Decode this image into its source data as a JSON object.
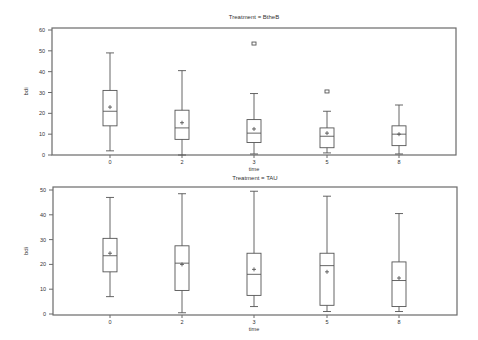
{
  "chart_data": [
    {
      "type": "box",
      "title": "Treatment = BtheB",
      "xlabel": "time",
      "ylabel": "bdi",
      "categories": [
        "0",
        "2",
        "3",
        "5",
        "8"
      ],
      "yticks": [
        0,
        10,
        20,
        30,
        40,
        50,
        60
      ],
      "ylim": [
        0,
        60
      ],
      "grid": false,
      "boxes": [
        {
          "x": "0",
          "whisker_low": 2,
          "q1": 14,
          "median": 21,
          "mean": 23,
          "q3": 31,
          "whisker_high": 49,
          "outliers": []
        },
        {
          "x": "2",
          "whisker_low": 0,
          "q1": 7.5,
          "median": 13,
          "mean": 15.5,
          "q3": 21.5,
          "whisker_high": 40.5,
          "outliers": []
        },
        {
          "x": "3",
          "whisker_low": 0.5,
          "q1": 6,
          "median": 10.5,
          "mean": 12.5,
          "q3": 17,
          "whisker_high": 29.5,
          "outliers": [
            53.5
          ]
        },
        {
          "x": "5",
          "whisker_low": 1,
          "q1": 3.5,
          "median": 9,
          "mean": 10.5,
          "q3": 13,
          "whisker_high": 21,
          "outliers": [
            30.5
          ]
        },
        {
          "x": "8",
          "whisker_low": 0.5,
          "q1": 4.5,
          "median": 10,
          "mean": 10,
          "q3": 14,
          "whisker_high": 24,
          "outliers": []
        }
      ]
    },
    {
      "type": "box",
      "title": "Treatment = TAU",
      "xlabel": "time",
      "ylabel": "bdi",
      "categories": [
        "0",
        "2",
        "3",
        "5",
        "8"
      ],
      "yticks": [
        0,
        10,
        20,
        30,
        40,
        50
      ],
      "ylim": [
        0,
        50
      ],
      "grid": false,
      "boxes": [
        {
          "x": "0",
          "whisker_low": 7,
          "q1": 17,
          "median": 23.5,
          "mean": 24.5,
          "q3": 30.5,
          "whisker_high": 47,
          "outliers": []
        },
        {
          "x": "2",
          "whisker_low": 0.5,
          "q1": 9.5,
          "median": 20.5,
          "mean": 20,
          "q3": 27.5,
          "whisker_high": 48.5,
          "outliers": []
        },
        {
          "x": "3",
          "whisker_low": 3,
          "q1": 7.5,
          "median": 16,
          "mean": 18,
          "q3": 24.5,
          "whisker_high": 49.5,
          "outliers": []
        },
        {
          "x": "5",
          "whisker_low": 1,
          "q1": 3.5,
          "median": 19.5,
          "mean": 17,
          "q3": 24.5,
          "whisker_high": 47.5,
          "outliers": []
        },
        {
          "x": "8",
          "whisker_low": 1,
          "q1": 3,
          "median": 13.5,
          "mean": 14.5,
          "q3": 21,
          "whisker_high": 40.5,
          "outliers": []
        }
      ]
    }
  ]
}
